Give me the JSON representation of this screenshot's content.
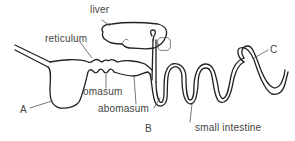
{
  "diagram": {
    "labels": {
      "liver": "liver",
      "reticulum": "reticulum",
      "omasum": "omasum",
      "abomasum": "abomasum",
      "small_intestine": "small intestine",
      "A": "A",
      "B": "B",
      "C": "C"
    },
    "colors": {
      "stroke": "#222222",
      "label_text": "#444444",
      "background": "#ffffff"
    }
  }
}
